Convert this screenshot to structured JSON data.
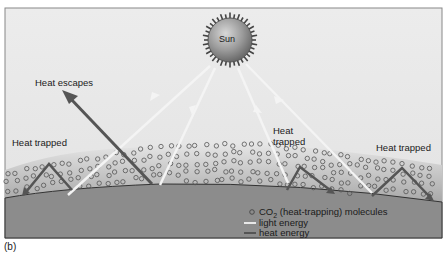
{
  "figure": {
    "panel_label": "(b)",
    "sun_label": "Sun",
    "labels": {
      "heat_escapes": "Heat escapes",
      "heat_trapped_left": "Heat trapped",
      "heat_trapped_center_line1": "Heat",
      "heat_trapped_center_line2": "trapped",
      "heat_trapped_right": "Heat trapped"
    },
    "legend": [
      {
        "key": "co2",
        "symbol": "circle",
        "label_prefix": "CO",
        "label_sub": "2",
        "label_suffix": " (heat-trapping) molecules"
      },
      {
        "key": "light",
        "symbol": "line",
        "color": "#e8e8e8",
        "label": "light energy"
      },
      {
        "key": "heat",
        "symbol": "line",
        "color": "#555555",
        "label": "heat energy"
      }
    ],
    "colors": {
      "sky": "#e9e9e9",
      "earth": "#8a8a8a",
      "atmosphere": "#b8b8b8",
      "sun": "#8f8f8f",
      "heat_arrow": "#5a5a5a",
      "light_ray": "#f2f2f2"
    }
  }
}
